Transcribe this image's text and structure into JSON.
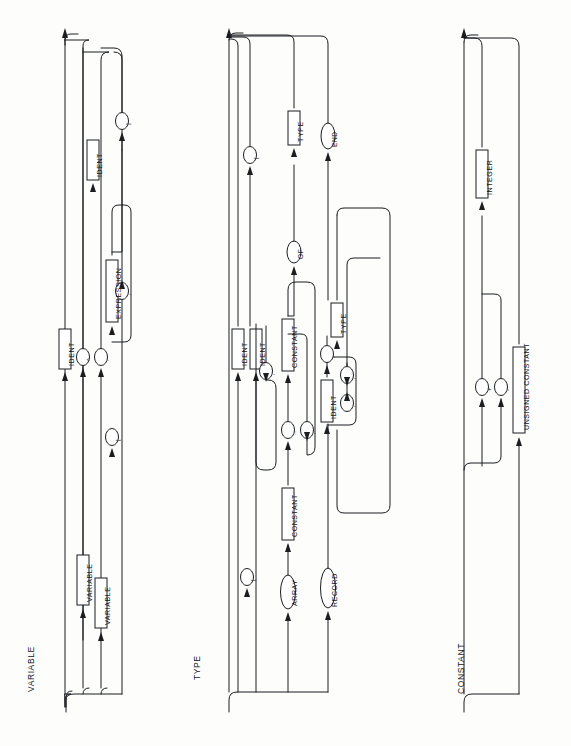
{
  "page": {
    "width": 571,
    "height": 746,
    "background": "#fdfdfc",
    "ink": "#1b1d20"
  },
  "diagrams": [
    {
      "id": "variable",
      "title": "VARIABLE",
      "title_pos": {
        "x": 24,
        "y": 688
      },
      "nonterminals": [
        "IDENT",
        "VARIABLE",
        "VARIABLE",
        "IDENT",
        "EXPRESSION"
      ],
      "terminals": [
        "^",
        ".",
        "[",
        ",",
        "]"
      ]
    },
    {
      "id": "type",
      "title": "TYPE",
      "title_pos": {
        "x": 190,
        "y": 676
      },
      "nonterminals": [
        "IDENT",
        "IDENT",
        "CONSTANT",
        "CONSTANT",
        "TYPE",
        "IDENT",
        "TYPE"
      ],
      "terminals": [
        "ARRAY",
        "RECORD",
        "[",
        "..",
        ",",
        "]",
        "OF",
        ",",
        ":",
        ";",
        "END"
      ]
    },
    {
      "id": "constant",
      "title": "CONSTANT",
      "title_pos": {
        "x": 455,
        "y": 690
      },
      "nonterminals": [
        "INTEGER",
        "UNSIGNED CONSTANT"
      ],
      "terminals": [
        "+",
        "-"
      ]
    }
  ],
  "nodes": {
    "variable": [
      {
        "name": "ident-entry",
        "label": "IDENT",
        "kind": "box",
        "cx": 65,
        "cy": 349,
        "w": 12,
        "h": 40
      },
      {
        "name": "variable-field",
        "label": "VARIABLE",
        "kind": "box",
        "cx": 82,
        "cy": 580,
        "w": 12,
        "h": 50
      },
      {
        "name": "variable-index",
        "label": "VARIABLE",
        "kind": "box",
        "cx": 100,
        "cy": 602,
        "w": 12,
        "h": 50
      },
      {
        "name": "ident-field",
        "label": "IDENT",
        "kind": "box",
        "cx": 92,
        "cy": 160,
        "w": 12,
        "h": 40
      },
      {
        "name": "expression",
        "label": "EXPRESSION",
        "kind": "box",
        "cx": 111,
        "cy": 291,
        "w": 12,
        "h": 62
      },
      {
        "name": "term-caret",
        "label": "^",
        "kind": "oval",
        "cx": 82,
        "cy": 355,
        "w": 13,
        "h": 17
      },
      {
        "name": "term-dot",
        "label": ".",
        "kind": "oval",
        "cx": 100,
        "cy": 357,
        "w": 13,
        "h": 17
      },
      {
        "name": "term-lbracket",
        "label": "[",
        "kind": "oval",
        "cx": 111,
        "cy": 437,
        "w": 13,
        "h": 17
      },
      {
        "name": "term-comma",
        "label": ",",
        "kind": "oval",
        "cx": 121,
        "cy": 291,
        "w": 13,
        "h": 17
      },
      {
        "name": "term-rbracket",
        "label": "]",
        "kind": "oval",
        "cx": 121,
        "cy": 121,
        "w": 13,
        "h": 17
      }
    ],
    "type": [
      {
        "name": "ident-simple",
        "label": "IDENT",
        "kind": "box",
        "cx": 238,
        "cy": 349,
        "w": 12,
        "h": 40
      },
      {
        "name": "ident-enum",
        "label": "IDENT",
        "kind": "box",
        "cx": 256,
        "cy": 349,
        "w": 12,
        "h": 40
      },
      {
        "name": "constant-lo",
        "label": "CONSTANT",
        "kind": "box",
        "cx": 288,
        "cy": 514,
        "w": 12,
        "h": 52
      },
      {
        "name": "constant-hi",
        "label": "CONSTANT",
        "kind": "box",
        "cx": 288,
        "cy": 345,
        "w": 12,
        "h": 52
      },
      {
        "name": "type-elem",
        "label": "TYPE",
        "kind": "box",
        "cx": 294,
        "cy": 128,
        "w": 12,
        "h": 34
      },
      {
        "name": "ident-rec-field",
        "label": "IDENT",
        "kind": "box",
        "cx": 327,
        "cy": 400,
        "w": 12,
        "h": 40
      },
      {
        "name": "type-rec-field",
        "label": "TYPE",
        "kind": "box",
        "cx": 337,
        "cy": 320,
        "w": 12,
        "h": 34
      },
      {
        "name": "term-lbracket-type",
        "label": "[",
        "kind": "oval",
        "cx": 250,
        "cy": 155,
        "w": 13,
        "h": 17
      },
      {
        "name": "term-comma-enum",
        "label": ",",
        "kind": "oval",
        "cx": 265,
        "cy": 371,
        "w": 13,
        "h": 17
      },
      {
        "name": "term-array",
        "label": "ARRAY",
        "kind": "oval",
        "cx": 288,
        "cy": 592,
        "w": 15,
        "h": 34
      },
      {
        "name": "term-lbracket-arr",
        "label": "[",
        "kind": "oval",
        "cx": 247,
        "cy": 577,
        "w": 13,
        "h": 17
      },
      {
        "name": "term-dotdot",
        "label": "..",
        "kind": "oval",
        "cx": 288,
        "cy": 430,
        "w": 13,
        "h": 17
      },
      {
        "name": "term-comma-arr",
        "label": ",",
        "kind": "oval",
        "cx": 307,
        "cy": 430,
        "w": 13,
        "h": 17
      },
      {
        "name": "term-of",
        "label": "OF",
        "kind": "oval",
        "cx": 294,
        "cy": 252,
        "w": 14,
        "h": 22
      },
      {
        "name": "term-record",
        "label": "RECORD",
        "kind": "oval",
        "cx": 328,
        "cy": 588,
        "w": 15,
        "h": 40
      },
      {
        "name": "term-comma-rec",
        "label": ",",
        "kind": "oval",
        "cx": 346,
        "cy": 403,
        "w": 13,
        "h": 17
      },
      {
        "name": "term-colon",
        "label": ":",
        "kind": "oval",
        "cx": 327,
        "cy": 354,
        "w": 13,
        "h": 17
      },
      {
        "name": "term-semicolon",
        "label": ";",
        "kind": "oval",
        "cx": 347,
        "cy": 375,
        "w": 13,
        "h": 17
      },
      {
        "name": "term-end",
        "label": "END",
        "kind": "oval",
        "cx": 328,
        "cy": 136,
        "w": 14,
        "h": 26
      }
    ],
    "constant": [
      {
        "name": "integer",
        "label": "INTEGER",
        "kind": "box",
        "cx": 482,
        "cy": 175,
        "w": 12,
        "h": 48
      },
      {
        "name": "unsigned-constant",
        "label": "UNSIGNED CONSTANT",
        "kind": "box",
        "cx": 519,
        "cy": 390,
        "w": 12,
        "h": 86
      },
      {
        "name": "term-plus",
        "label": "+",
        "kind": "oval",
        "cx": 482,
        "cy": 387,
        "w": 13,
        "h": 17
      },
      {
        "name": "term-minus",
        "label": "-",
        "kind": "oval",
        "cx": 500,
        "cy": 387,
        "w": 13,
        "h": 17
      }
    ]
  }
}
